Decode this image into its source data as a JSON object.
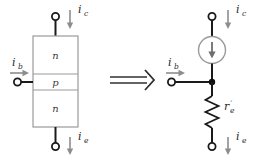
{
  "diagram": {
    "transform_symbol": "implies-double-arrow"
  },
  "colors": {
    "background": "#ffffff",
    "wire": "#1a1a1a",
    "box_outline": "#9a9a9a",
    "label": "#2b2b2b",
    "arrow": "#8d8d8d",
    "source_outline": "#9a9a9a",
    "junction_dot": "#111111"
  },
  "left_model": {
    "name": "npn-transistor-block",
    "regions": [
      {
        "label": "n",
        "position": "top"
      },
      {
        "label": "p",
        "position": "middle"
      },
      {
        "label": "n",
        "position": "bottom"
      }
    ],
    "currents": {
      "collector": {
        "symbol": "i",
        "subscript": "c",
        "direction": "down"
      },
      "base": {
        "symbol": "i",
        "subscript": "b",
        "direction": "right"
      },
      "emitter": {
        "symbol": "i",
        "subscript": "e",
        "direction": "down"
      }
    },
    "terminals": [
      "collector",
      "base",
      "emitter"
    ]
  },
  "right_model": {
    "name": "equivalent-circuit-model",
    "current_source": {
      "direction": "down",
      "shape": "circle"
    },
    "resistor": {
      "symbol": "r",
      "prime": "′",
      "subscript": "e"
    },
    "currents": {
      "collector": {
        "symbol": "i",
        "subscript": "c",
        "direction": "down"
      },
      "base": {
        "symbol": "i",
        "subscript": "b",
        "direction": "right"
      },
      "emitter": {
        "symbol": "i",
        "subscript": "e",
        "direction": "down"
      }
    },
    "terminals": [
      "collector",
      "base",
      "emitter"
    ],
    "junction": "base-emitter-node"
  }
}
